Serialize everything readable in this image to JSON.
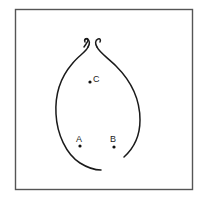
{
  "diagram": {
    "type": "bulb-shaped closed curve with open neck and three labeled points",
    "frame_color": "#555555",
    "curve_color": "#1a1a1a",
    "points": [
      {
        "label": "C",
        "x": 90,
        "y": 82
      },
      {
        "label": "A",
        "x": 80,
        "y": 146
      },
      {
        "label": "B",
        "x": 114,
        "y": 147
      }
    ]
  }
}
